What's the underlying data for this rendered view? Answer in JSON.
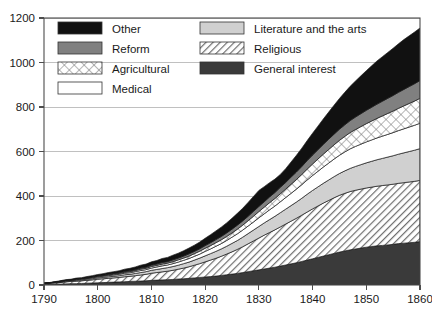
{
  "chart_data": {
    "type": "area",
    "title": "",
    "subtitle": "",
    "xlabel": "",
    "ylabel": "",
    "stacked": true,
    "grid": true,
    "legend_position": "top-inside",
    "xlim": [
      1790,
      1860
    ],
    "ylim": [
      0,
      1200
    ],
    "xticks": [
      1790,
      1800,
      1810,
      1820,
      1830,
      1840,
      1850,
      1860
    ],
    "yticks": [
      0,
      200,
      400,
      600,
      800,
      1000,
      1200
    ],
    "xtick_labels": [
      "1790",
      "1800",
      "1810",
      "1820",
      "1830",
      "1840",
      "1850",
      "1860"
    ],
    "ytick_labels": [
      "0",
      "200",
      "400",
      "600",
      "800",
      "1000",
      "1200"
    ],
    "x": [
      1790,
      1791,
      1792,
      1793,
      1794,
      1795,
      1796,
      1797,
      1798,
      1799,
      1800,
      1801,
      1802,
      1803,
      1804,
      1805,
      1806,
      1807,
      1808,
      1809,
      1810,
      1811,
      1812,
      1813,
      1814,
      1815,
      1816,
      1817,
      1818,
      1819,
      1820,
      1821,
      1822,
      1823,
      1824,
      1825,
      1826,
      1827,
      1828,
      1829,
      1830,
      1831,
      1832,
      1833,
      1834,
      1835,
      1836,
      1837,
      1838,
      1839,
      1840,
      1841,
      1842,
      1843,
      1844,
      1845,
      1846,
      1847,
      1848,
      1849,
      1850,
      1851,
      1852,
      1853,
      1854,
      1855,
      1856,
      1857,
      1858,
      1859,
      1860
    ],
    "series": [
      {
        "name": "General interest",
        "fill": "#3a3a3a",
        "pattern": "solid-dark",
        "values": [
          2,
          3,
          3,
          4,
          5,
          6,
          6,
          7,
          8,
          9,
          10,
          11,
          12,
          13,
          14,
          15,
          16,
          17,
          18,
          19,
          21,
          22,
          23,
          24,
          25,
          27,
          28,
          30,
          32,
          34,
          36,
          38,
          40,
          43,
          46,
          49,
          52,
          56,
          60,
          64,
          68,
          72,
          76,
          80,
          85,
          90,
          95,
          100,
          106,
          112,
          118,
          124,
          130,
          136,
          142,
          148,
          153,
          158,
          162,
          166,
          170,
          173,
          176,
          178,
          180,
          183,
          186,
          188,
          190,
          192,
          195
        ]
      },
      {
        "name": "Religious",
        "fill": "#ffffff",
        "pattern": "diagonal-hatch",
        "values": [
          4,
          5,
          6,
          7,
          9,
          10,
          11,
          12,
          13,
          14,
          16,
          17,
          18,
          19,
          20,
          22,
          23,
          25,
          27,
          29,
          32,
          34,
          36,
          38,
          41,
          44,
          48,
          52,
          57,
          62,
          68,
          74,
          80,
          86,
          93,
          100,
          108,
          116,
          125,
          134,
          143,
          152,
          160,
          168,
          176,
          184,
          192,
          200,
          208,
          216,
          224,
          231,
          238,
          244,
          250,
          255,
          259,
          262,
          264,
          265,
          266,
          267,
          268,
          269,
          270,
          270,
          271,
          272,
          273,
          274,
          275
        ]
      },
      {
        "name": "Literature and the arts",
        "fill": "#d0d0d0",
        "pattern": "solid-light",
        "values": [
          1,
          1,
          2,
          2,
          3,
          3,
          4,
          4,
          5,
          5,
          6,
          6,
          7,
          7,
          8,
          9,
          9,
          10,
          11,
          12,
          13,
          14,
          15,
          16,
          17,
          18,
          20,
          21,
          23,
          25,
          27,
          29,
          31,
          33,
          35,
          38,
          40,
          43,
          46,
          49,
          52,
          55,
          58,
          61,
          64,
          67,
          70,
          73,
          76,
          80,
          83,
          86,
          89,
          92,
          95,
          98,
          101,
          104,
          107,
          110,
          113,
          116,
          119,
          122,
          125,
          128,
          131,
          134,
          137,
          140,
          143
        ]
      },
      {
        "name": "Medical",
        "fill": "#ffffff",
        "pattern": "solid-white",
        "values": [
          1,
          1,
          1,
          2,
          2,
          2,
          3,
          3,
          3,
          4,
          4,
          5,
          5,
          6,
          6,
          7,
          7,
          8,
          9,
          9,
          10,
          11,
          12,
          12,
          13,
          14,
          15,
          16,
          17,
          18,
          20,
          21,
          23,
          24,
          26,
          28,
          30,
          32,
          34,
          36,
          39,
          41,
          44,
          46,
          49,
          52,
          55,
          58,
          61,
          64,
          67,
          70,
          73,
          76,
          79,
          82,
          85,
          88,
          90,
          92,
          94,
          96,
          98,
          100,
          102,
          104,
          106,
          108,
          110,
          112,
          114
        ]
      },
      {
        "name": "Agricultural",
        "fill": "#ffffff",
        "pattern": "cross-hatch",
        "values": [
          0,
          0,
          1,
          1,
          1,
          1,
          2,
          2,
          2,
          2,
          3,
          3,
          3,
          4,
          4,
          4,
          5,
          5,
          6,
          6,
          7,
          7,
          8,
          8,
          9,
          10,
          10,
          11,
          12,
          13,
          14,
          15,
          16,
          17,
          18,
          19,
          21,
          22,
          24,
          26,
          28,
          30,
          32,
          34,
          36,
          38,
          41,
          43,
          46,
          49,
          52,
          55,
          58,
          61,
          64,
          67,
          70,
          73,
          76,
          79,
          82,
          85,
          88,
          91,
          94,
          97,
          100,
          103,
          106,
          109,
          112
        ]
      },
      {
        "name": "Reform",
        "fill": "#808080",
        "pattern": "solid-medium",
        "values": [
          0,
          0,
          0,
          1,
          1,
          1,
          1,
          1,
          2,
          2,
          2,
          2,
          3,
          3,
          3,
          4,
          4,
          4,
          5,
          5,
          6,
          6,
          7,
          7,
          8,
          8,
          9,
          10,
          10,
          11,
          12,
          13,
          14,
          15,
          16,
          17,
          18,
          19,
          20,
          22,
          23,
          24,
          26,
          27,
          29,
          30,
          32,
          34,
          36,
          38,
          40,
          42,
          44,
          46,
          48,
          50,
          52,
          54,
          56,
          58,
          60,
          62,
          64,
          66,
          68,
          70,
          72,
          74,
          76,
          78,
          80
        ]
      },
      {
        "name": "Other",
        "fill": "#111111",
        "pattern": "solid-black",
        "values": [
          1,
          1,
          2,
          2,
          3,
          3,
          4,
          4,
          5,
          6,
          6,
          7,
          8,
          8,
          9,
          10,
          11,
          12,
          13,
          14,
          15,
          16,
          18,
          19,
          21,
          22,
          24,
          26,
          28,
          30,
          33,
          36,
          39,
          42,
          45,
          49,
          53,
          57,
          62,
          67,
          72,
          68,
          64,
          60,
          58,
          62,
          68,
          75,
          82,
          90,
          98,
          106,
          114,
          122,
          130,
          138,
          146,
          154,
          162,
          170,
          178,
          186,
          194,
          200,
          206,
          212,
          218,
          224,
          228,
          232,
          236
        ]
      }
    ],
    "legend": [
      {
        "label": "Other",
        "pattern": "solid-black",
        "column": 0
      },
      {
        "label": "Reform",
        "pattern": "solid-medium",
        "column": 0
      },
      {
        "label": "Agricultural",
        "pattern": "cross-hatch",
        "column": 0
      },
      {
        "label": "Medical",
        "pattern": "solid-white",
        "column": 0
      },
      {
        "label": "Literature and the arts",
        "pattern": "solid-light",
        "column": 1
      },
      {
        "label": "Religious",
        "pattern": "diagonal-hatch",
        "column": 1
      },
      {
        "label": "General interest",
        "pattern": "solid-dark",
        "column": 1
      }
    ],
    "colors": {
      "other": "#111111",
      "reform": "#808080",
      "agricultural": "#ffffff",
      "medical": "#ffffff",
      "literature": "#d0d0d0",
      "religious": "#ffffff",
      "general_interest": "#3a3a3a",
      "grid": "#b0b0b0",
      "axis": "#4d4d4d",
      "text": "#1a1a1a",
      "background": "#ffffff"
    }
  }
}
